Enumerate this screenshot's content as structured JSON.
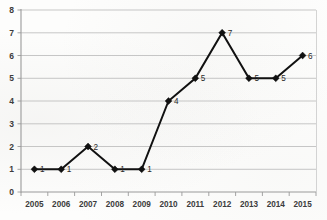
{
  "chart_data": {
    "type": "line",
    "title": "",
    "xlabel": "",
    "ylabel": "",
    "categories": [
      "2005",
      "2006",
      "2007",
      "2008",
      "2009",
      "2010",
      "2011",
      "2012",
      "2013",
      "2014",
      "2015"
    ],
    "values": [
      1,
      1,
      2,
      1,
      1,
      4,
      5,
      7,
      5,
      5,
      6
    ],
    "point_labels": [
      "1",
      "1",
      "2",
      "1",
      "1",
      "4",
      "5",
      "7",
      "5",
      "5",
      "6"
    ],
    "ylim": [
      0,
      8
    ],
    "yticks": [
      0,
      1,
      2,
      3,
      4,
      5,
      6,
      7,
      8
    ],
    "ytick_labels": [
      "0",
      "1",
      "2",
      "3",
      "4",
      "5",
      "6",
      "7",
      "8"
    ],
    "grid": true,
    "grid_axis": "y",
    "legend": "none",
    "legend_position": "none",
    "marker": "diamond",
    "series": [
      {
        "name": "",
        "values": [
          1,
          1,
          2,
          1,
          1,
          4,
          5,
          7,
          5,
          5,
          6
        ]
      }
    ]
  },
  "style": {
    "line_color": "#111111",
    "marker_color": "#111111",
    "grid_color": "#b9b9b9",
    "axis_color": "#9a9a9a",
    "label_color": "#3c3c3c",
    "background": "#fdfdfc"
  }
}
